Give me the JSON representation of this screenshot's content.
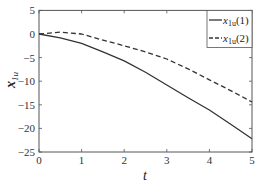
{
  "chart_data": {
    "type": "line",
    "title": "",
    "xlabel": "t",
    "ylabel": "x_1u",
    "xlim": [
      0,
      5
    ],
    "ylim": [
      -25,
      5
    ],
    "xticks": [
      0,
      1,
      2,
      3,
      4,
      5
    ],
    "yticks": [
      5,
      0,
      -5,
      -10,
      -15,
      -20,
      -25
    ],
    "grid": false,
    "legend_position": "upper right",
    "x": [
      0,
      0.5,
      1.0,
      1.5,
      2.0,
      2.5,
      3.0,
      3.5,
      4.0,
      4.5,
      5.0
    ],
    "series": [
      {
        "name": "x_1u(1)",
        "style": "solid",
        "color": "#333333",
        "values": [
          0,
          -0.8,
          -2.0,
          -3.8,
          -5.7,
          -8.1,
          -10.8,
          -13.5,
          -16.1,
          -19.1,
          -22.2
        ]
      },
      {
        "name": "x_1u(2)",
        "style": "dashed",
        "color": "#333333",
        "values": [
          0,
          0.4,
          0.0,
          -1.3,
          -2.5,
          -3.8,
          -5.3,
          -7.4,
          -9.7,
          -12.0,
          -14.4
        ]
      }
    ]
  },
  "axes": {
    "x_label": "t",
    "y_label_main": "x",
    "y_label_sub": "1u",
    "x_tick_labels": [
      "0",
      "1",
      "2",
      "3",
      "4",
      "5"
    ],
    "y_tick_labels": [
      "5",
      "0",
      "−5",
      "−10",
      "−15",
      "−20",
      "−25"
    ]
  },
  "legend": {
    "entries": [
      {
        "main": "x",
        "sub": "1u",
        "suffix": "(1)",
        "style": "solid"
      },
      {
        "main": "x",
        "sub": "1u",
        "suffix": "(2)",
        "style": "dashed"
      }
    ]
  }
}
